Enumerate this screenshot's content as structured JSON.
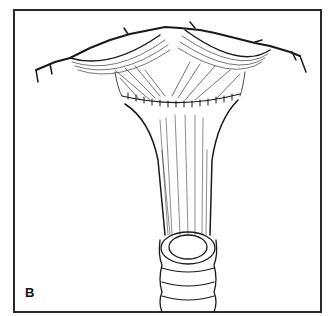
{
  "figure": {
    "panel_label": "B",
    "colors": {
      "line": "#1a1a1a",
      "background": "#ffffff",
      "frame": "#2a2a2a"
    }
  }
}
